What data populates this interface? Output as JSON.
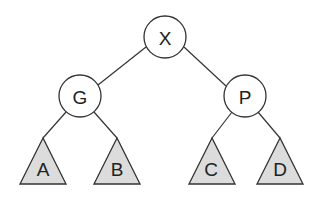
{
  "diagram": {
    "type": "binary-tree",
    "root": {
      "label": "X",
      "kind": "node",
      "children": [
        {
          "label": "G",
          "kind": "node",
          "children": [
            {
              "label": "A",
              "kind": "subtree"
            },
            {
              "label": "B",
              "kind": "subtree"
            }
          ]
        },
        {
          "label": "P",
          "kind": "node",
          "children": [
            {
              "label": "C",
              "kind": "subtree"
            },
            {
              "label": "D",
              "kind": "subtree"
            }
          ]
        }
      ]
    },
    "nodes": {
      "x": "X",
      "g": "G",
      "p": "P"
    },
    "subtrees": {
      "a": "A",
      "b": "B",
      "c": "C",
      "d": "D"
    },
    "colors": {
      "node_fill": "#ffffff",
      "subtree_fill": "#dcdcdc",
      "stroke": "#333333"
    }
  }
}
